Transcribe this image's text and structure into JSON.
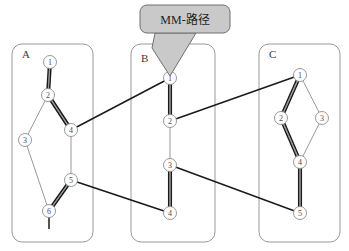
{
  "diagram": {
    "title": "",
    "callout": {
      "label": "MM-路径",
      "box": {
        "x": 140,
        "y": 5,
        "w": 90,
        "h": 28,
        "r": 7
      },
      "tail_points": "155,33 196,33 170,76 152,48",
      "fill": "#c9c9c9",
      "stroke": "#6f6f6f"
    },
    "panels": [
      {
        "id": "A",
        "label": "A",
        "x": 12,
        "y": 44,
        "w": 81,
        "h": 198,
        "label_x": 22,
        "label_y": 58
      },
      {
        "id": "B",
        "label": "B",
        "x": 131,
        "y": 44,
        "w": 84,
        "h": 198,
        "label_x": 141,
        "label_y": 62
      },
      {
        "id": "C",
        "label": "C",
        "x": 259,
        "y": 44,
        "w": 81,
        "h": 198,
        "label_x": 269,
        "label_y": 58
      }
    ],
    "nodes": [
      {
        "id": "A1",
        "panel": "A",
        "label": "1",
        "x": 50,
        "y": 62,
        "r": 6.5
      },
      {
        "id": "A2",
        "panel": "A",
        "label": "2",
        "x": 48,
        "y": 95,
        "r": 6.5
      },
      {
        "id": "A3",
        "panel": "A",
        "label": "3",
        "x": 25,
        "y": 140,
        "r": 6.5
      },
      {
        "id": "A4",
        "panel": "A",
        "label": "4",
        "x": 71,
        "y": 130,
        "r": 6.5
      },
      {
        "id": "A5",
        "panel": "A",
        "label": "5",
        "x": 71,
        "y": 180,
        "r": 6.5
      },
      {
        "id": "A6",
        "panel": "A",
        "label": "6",
        "x": 49,
        "y": 211,
        "r": 6.5
      },
      {
        "id": "B1",
        "panel": "B",
        "label": "1",
        "x": 170,
        "y": 78,
        "r": 6.5
      },
      {
        "id": "B2",
        "panel": "B",
        "label": "2",
        "x": 170,
        "y": 121,
        "r": 6.5
      },
      {
        "id": "B3",
        "panel": "B",
        "label": "3",
        "x": 170,
        "y": 165,
        "r": 6.5
      },
      {
        "id": "B4",
        "panel": "B",
        "label": "4",
        "x": 170,
        "y": 213,
        "r": 6.5
      },
      {
        "id": "C1",
        "panel": "C",
        "label": "1",
        "x": 300,
        "y": 75,
        "r": 6.5
      },
      {
        "id": "C2",
        "panel": "C",
        "label": "2",
        "x": 281,
        "y": 118,
        "r": 6.5
      },
      {
        "id": "C3",
        "panel": "C",
        "label": "3",
        "x": 322,
        "y": 118,
        "r": 6.5
      },
      {
        "id": "C4",
        "panel": "C",
        "label": "4",
        "x": 300,
        "y": 162,
        "r": 6.5
      },
      {
        "id": "C5",
        "panel": "C",
        "label": "5",
        "x": 300,
        "y": 213,
        "r": 6.5
      }
    ],
    "edges_thin": [
      {
        "from": "A1",
        "to": "A2"
      },
      {
        "from": "A2",
        "to": "A3"
      },
      {
        "from": "A2",
        "to": "A4"
      },
      {
        "from": "A3",
        "to": "A6"
      },
      {
        "from": "A4",
        "to": "A5"
      },
      {
        "from": "A5",
        "to": "A6"
      },
      {
        "from": "B1",
        "to": "B2"
      },
      {
        "from": "B2",
        "to": "B3"
      },
      {
        "from": "B3",
        "to": "B4"
      },
      {
        "from": "C1",
        "to": "C2"
      },
      {
        "from": "C1",
        "to": "C3"
      },
      {
        "from": "C2",
        "to": "C4"
      },
      {
        "from": "C3",
        "to": "C4"
      },
      {
        "from": "C4",
        "to": "C5"
      }
    ],
    "edges_thick": [
      {
        "from": "A1",
        "to": "A2",
        "note": "MM path within A"
      },
      {
        "from": "A2",
        "to": "A4",
        "note": "MM path within A"
      },
      {
        "from": "A4",
        "to": "B1",
        "note": "MM path A to B"
      },
      {
        "from": "B1",
        "to": "B2",
        "note": "MM path within B"
      },
      {
        "from": "B2",
        "to": "C1",
        "note": "MM path B to C"
      },
      {
        "from": "C1",
        "to": "C2",
        "note": "MM path within C"
      },
      {
        "from": "C2",
        "to": "C4",
        "note": "MM path within C"
      },
      {
        "from": "C4",
        "to": "C5",
        "note": "MM path within C"
      },
      {
        "from": "A5",
        "to": "A6",
        "note": "MM path within A"
      },
      {
        "from": "A5",
        "to": "B4",
        "note": "MM path A to B"
      },
      {
        "from": "B4",
        "to": "B3",
        "note": "MM path within B"
      },
      {
        "from": "B3",
        "to": "C5",
        "note": "MM path B to C"
      }
    ],
    "stub_segments": [
      {
        "from_node": "A6",
        "dx": 0,
        "dy": 18,
        "note": "path continues below node A6"
      }
    ],
    "colors": {
      "panel_stroke": "#9a9a9a",
      "node_stroke": "#8c8c8c",
      "edge_thin": "#8c8c8c",
      "edge_thick": "#1a1a1a",
      "callout_fill": "#c9c9c9",
      "background": "#ffffff"
    }
  }
}
